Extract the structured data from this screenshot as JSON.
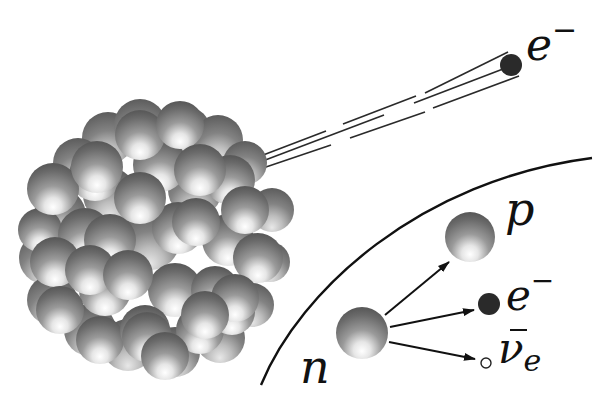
{
  "diagram": {
    "background": "#ffffff",
    "colors": {
      "ink": "#111111",
      "electron": "#2a2a2a",
      "nucleon_dark": "#5e5e5e",
      "nucleon_light": "#f2f2f2"
    },
    "emitted_electron": {
      "label_base": "e",
      "label_sup": "−",
      "x": 511,
      "y": 65,
      "r": 11
    },
    "trail": {
      "from": [
        258,
        162
      ],
      "to": [
        511,
        65
      ],
      "line_count": 3
    },
    "nucleus": {
      "cx": 150,
      "cy": 240,
      "radius": 135,
      "nucleon_radius": 26
    },
    "boundary_curve": {
      "description": "arc separating nucleus view from decay inset"
    },
    "decay": {
      "neutron": {
        "label": "n",
        "x": 362,
        "y": 333,
        "r": 26
      },
      "proton": {
        "label": "p",
        "x": 470,
        "y": 237,
        "r": 25
      },
      "electron": {
        "label_base": "e",
        "label_sup": "−",
        "x": 489,
        "y": 304,
        "r": 11
      },
      "antineutrino": {
        "label_base": "ν",
        "label_bar": "¯",
        "label_sub": "e",
        "x": 486,
        "y": 362,
        "r": 5
      }
    }
  }
}
